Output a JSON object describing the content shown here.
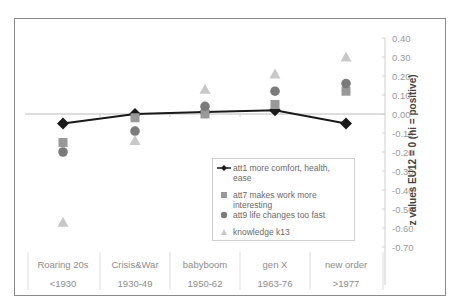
{
  "chart_data": {
    "type": "line",
    "title": "",
    "xlabel": "",
    "ylabel": "z values EU12 = 0 (hi = positive)",
    "ylim": [
      -0.7,
      0.4
    ],
    "yticks": [
      "0.40",
      "0.30",
      "0.20",
      "0.10",
      "0.00",
      "-0.10",
      "-0.20",
      "-0.30",
      "-0.40",
      "-0.50",
      "-0.60",
      "-0.70"
    ],
    "y_axis_position": "right",
    "grid": false,
    "legend_position": "inside center-right",
    "categories": [
      {
        "name": "Roaring 20s",
        "period": "<1930"
      },
      {
        "name": "Crisis&War",
        "period": "1930-49"
      },
      {
        "name": "babyboom",
        "period": "1950-62"
      },
      {
        "name": "gen X",
        "period": "1963-76"
      },
      {
        "name": "new order",
        "period": ">1977"
      }
    ],
    "series": [
      {
        "name": "att1 more comfort, health, ease",
        "marker": "diamond",
        "line": true,
        "color": "#1a1a1a",
        "values": [
          -0.05,
          0.0,
          0.01,
          0.02,
          -0.05
        ]
      },
      {
        "name": "att7 makes work more interesting",
        "marker": "square",
        "line": false,
        "color": "#999999",
        "values": [
          -0.15,
          -0.02,
          0.0,
          0.05,
          0.12
        ]
      },
      {
        "name": "att9 life changes too fast",
        "marker": "circle",
        "line": false,
        "color": "#7a7a7a",
        "values": [
          -0.2,
          -0.09,
          0.04,
          0.12,
          0.16
        ]
      },
      {
        "name": "knowledge k13",
        "marker": "triangle",
        "line": false,
        "color": "#c8c8c8",
        "values": [
          -0.57,
          -0.14,
          0.13,
          0.21,
          0.3
        ]
      }
    ]
  },
  "legend": {
    "items": [
      {
        "label_line1": "att1 more comfort, health, ease",
        "label_line2": ""
      },
      {
        "label_line1": "att7 makes work more",
        "label_line2": "interesting"
      },
      {
        "label_line1": "att9 life changes too fast",
        "label_line2": ""
      },
      {
        "label_line1": "knowledge k13",
        "label_line2": ""
      }
    ]
  }
}
